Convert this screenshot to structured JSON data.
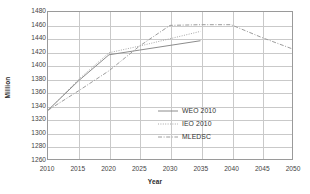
{
  "chart_data": {
    "type": "line",
    "title": "",
    "xlabel": "Year",
    "ylabel": "Million",
    "xlim": [
      2010,
      2050
    ],
    "ylim": [
      1260,
      1480
    ],
    "ytick_step": 20,
    "xtick_step": 5,
    "grid": "both",
    "legend_position": "bottom-right-inside",
    "x": [
      2010,
      2015,
      2020,
      2025,
      2030,
      2035,
      2040,
      2045,
      2050
    ],
    "xticklabels": [
      "2010",
      "2015",
      "2020",
      "2025",
      "2030",
      "2035",
      "2040",
      "2045",
      "2050"
    ],
    "yticklabels": [
      "1260",
      "1280",
      "1300",
      "1320",
      "1340",
      "1360",
      "1380",
      "1400",
      "1420",
      "1440",
      "1460",
      "1480"
    ],
    "series": [
      {
        "name": "WEO 2010",
        "style": "solid",
        "color": "#8c8c8c",
        "x": [
          2010,
          2015,
          2020,
          2025,
          2030,
          2035
        ],
        "values": [
          1333,
          1377,
          1416,
          1423,
          1430,
          1437
        ]
      },
      {
        "name": "IEO 2010",
        "style": "dotted",
        "color": "#a8a8a8",
        "x": [
          2010,
          2015,
          2020,
          2025,
          2030,
          2035
        ],
        "values": [
          1333,
          1379,
          1419,
          1429,
          1440,
          1451
        ]
      },
      {
        "name": "MLEDSC",
        "style": "dash-dot",
        "color": "#9c9c9c",
        "x": [
          2010,
          2015,
          2020,
          2025,
          2030,
          2035,
          2040,
          2045,
          2050
        ],
        "values": [
          1333,
          1362,
          1392,
          1429,
          1460,
          1461,
          1461,
          1442,
          1425
        ]
      }
    ]
  },
  "legend": {
    "items": [
      {
        "label": "WEO 2010"
      },
      {
        "label": "IEO 2010"
      },
      {
        "label": "MLEDSC"
      }
    ]
  },
  "colors": {
    "grid": "#c9c9c9",
    "frame": "#9a9a9a",
    "text": "#3a3a3a",
    "plot_background": "#ffffff"
  }
}
